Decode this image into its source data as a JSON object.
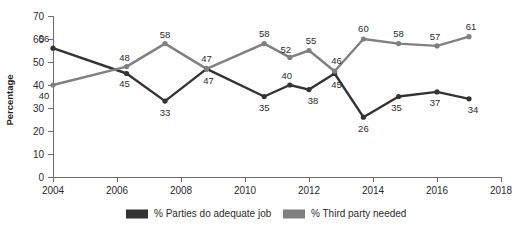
{
  "chart_data": {
    "type": "line",
    "title": "",
    "xlabel": "",
    "ylabel": "Percentage",
    "xlim": [
      2004,
      2018
    ],
    "ylim": [
      0,
      70
    ],
    "ygrid": false,
    "xticks": [
      2004,
      2006,
      2008,
      2010,
      2012,
      2014,
      2016,
      2018
    ],
    "yticks": [
      0,
      10,
      20,
      30,
      40,
      50,
      60,
      70
    ],
    "legend_position": "bottom",
    "x": [
      2004,
      2006.3,
      2007.5,
      2008.8,
      2010.6,
      2011.4,
      2012.0,
      2012.8,
      2013.7,
      2014.8,
      2016.0,
      2017.0
    ],
    "series": [
      {
        "name": "% Parties do adequate job",
        "color": "#333333",
        "values": [
          56,
          45,
          33,
          47,
          35,
          40,
          38,
          45,
          26,
          35,
          37,
          34
        ]
      },
      {
        "name": "% Third party needed",
        "color": "#808080",
        "values": [
          40,
          48,
          58,
          47,
          58,
          52,
          55,
          46,
          60,
          58,
          57,
          61
        ]
      }
    ]
  },
  "axis": {
    "ylabel": "Percentage",
    "ytick_labels": [
      "0",
      "10",
      "20",
      "30",
      "40",
      "50",
      "60",
      "70"
    ],
    "xtick_labels": [
      "2004",
      "2006",
      "2008",
      "2010",
      "2012",
      "2014",
      "2016",
      "2018"
    ]
  },
  "legend": {
    "items": [
      {
        "label": "% Parties do adequate job",
        "color": "#333333"
      },
      {
        "label": "% Third party needed",
        "color": "#808080"
      }
    ]
  }
}
